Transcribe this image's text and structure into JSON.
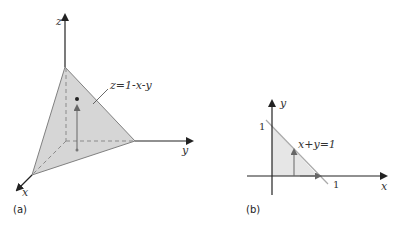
{
  "panel_a": {
    "label": "(a)",
    "axes": {
      "x": "x",
      "y": "y",
      "z": "z"
    },
    "surface_label": "z=1-x-y",
    "colors": {
      "fill": "#d6d6d6",
      "edge": "#808080",
      "axis": "#222222",
      "dashed": "#8a8a8a",
      "arrow": "#666666"
    }
  },
  "panel_b": {
    "label": "(b)",
    "axes": {
      "x": "x",
      "y": "y"
    },
    "line_label": "x+y=1",
    "tick_x": "1",
    "tick_y": "1",
    "colors": {
      "fill": "#e6e6e6",
      "line": "#aaaaaa",
      "axis": "#222222",
      "arrow": "#666666"
    }
  }
}
